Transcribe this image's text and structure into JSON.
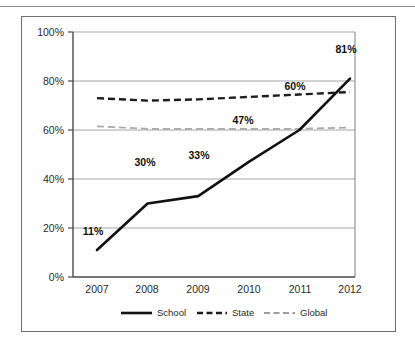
{
  "figure": {
    "frame_border_color": "#6f6f6f",
    "background": "#fefefe"
  },
  "chart_data": {
    "type": "line",
    "title": "",
    "xlabel": "",
    "ylabel": "",
    "categories": [
      "2007",
      "2008",
      "2009",
      "2010",
      "2011",
      "2012"
    ],
    "x_tick_labels": [
      "2007",
      "2008",
      "2009",
      "2010",
      "2011",
      "2012"
    ],
    "y_tick_labels": [
      "0%",
      "20%",
      "40%",
      "60%",
      "80%",
      "100%"
    ],
    "y_tick_values": [
      0,
      20,
      40,
      60,
      80,
      100
    ],
    "ylim": [
      0,
      100
    ],
    "grid": "horizontal",
    "legend_position": "bottom",
    "series": [
      {
        "name": "School",
        "style": "solid",
        "color": "#111111",
        "width": 2.6,
        "values": [
          11,
          30,
          33,
          47,
          60,
          81
        ],
        "point_labels": [
          "11%",
          "30%",
          "33%",
          "47%",
          "60%",
          "81%"
        ]
      },
      {
        "name": "State",
        "style": "dashed",
        "color": "#1d1d1d",
        "width": 2.4,
        "values": [
          73,
          72,
          72.5,
          73.5,
          74.5,
          75.5
        ],
        "point_labels": []
      },
      {
        "name": "Global",
        "style": "dashed-light",
        "color": "#a9a9a9",
        "width": 1.7,
        "values": [
          61.5,
          60.5,
          60.5,
          60.5,
          60.5,
          61
        ],
        "point_labels": []
      }
    ]
  },
  "legend": {
    "items": [
      {
        "label": "School",
        "style": "solid"
      },
      {
        "label": "State",
        "style": "dashed"
      },
      {
        "label": "Global",
        "style": "dashed-light"
      }
    ]
  }
}
